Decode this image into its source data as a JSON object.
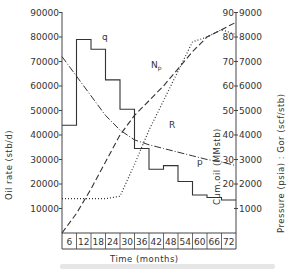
{
  "chart_data": {
    "type": "line",
    "title": "",
    "xlabel": "Time (months)",
    "ylabel_left": "Oil rate (stb/d)",
    "ylabel_right_inner": "Cum.oil (MMstb)",
    "ylabel_right_outer": "Pressure (psia) : Gor (scf/stb)",
    "x_ticks": [
      "6",
      "12",
      "18",
      "24",
      "30",
      "36",
      "42",
      "48",
      "54",
      "60",
      "66",
      "72"
    ],
    "y_left_ticks": [
      "10000",
      "20000",
      "30000",
      "40000",
      "50000",
      "60000",
      "70000",
      "80000",
      "90000"
    ],
    "y_right_inner_ticks": [
      "20",
      "30",
      "40",
      "50",
      "60",
      "70",
      "80",
      "90"
    ],
    "y_right_outer_ticks": [
      "1000",
      "2000",
      "3000",
      "4000",
      "5000",
      "6000",
      "7000",
      "8000",
      "9000"
    ],
    "xlim": [
      0,
      72
    ],
    "ylim_left": [
      0,
      90000
    ],
    "ylim_right_inner": [
      0,
      90
    ],
    "ylim_right_outer": [
      0,
      9000
    ],
    "grid": false,
    "series": [
      {
        "name": "q",
        "label": "q",
        "style": "step-solid",
        "axis": "left",
        "x": [
          0,
          6,
          12,
          18,
          24,
          30,
          36,
          42,
          48,
          54,
          60,
          66,
          72
        ],
        "values": [
          44000,
          79000,
          75000,
          62500,
          50500,
          34500,
          26000,
          27500,
          21000,
          15500,
          14500,
          13500,
          13500
        ]
      },
      {
        "name": "Np",
        "label": "Np",
        "style": "dashed",
        "axis": "right_inner",
        "x": [
          0,
          6,
          12,
          18,
          24,
          30,
          36,
          42,
          48,
          54,
          60,
          66,
          72
        ],
        "values": [
          0,
          8,
          18,
          29,
          40,
          48,
          54,
          60,
          67,
          74,
          80,
          83,
          86
        ]
      },
      {
        "name": "R",
        "label": "R",
        "style": "dotted",
        "axis": "right_outer",
        "x": [
          0,
          6,
          12,
          18,
          24,
          30,
          36,
          42,
          48,
          54,
          60,
          66,
          72
        ],
        "values": [
          1400,
          1400,
          1400,
          1400,
          1500,
          2800,
          4200,
          5400,
          6600,
          7800,
          8000,
          8300,
          8100
        ]
      },
      {
        "name": "p",
        "label": "p",
        "style": "dash-dot",
        "axis": "right_outer",
        "x": [
          0,
          6,
          12,
          18,
          24,
          30,
          36,
          42,
          48,
          54,
          60,
          66,
          72
        ],
        "values": [
          7200,
          6400,
          5600,
          4800,
          4200,
          3800,
          3600,
          3450,
          3300,
          3150,
          3000,
          2900,
          2750
        ]
      }
    ]
  },
  "caption": ""
}
